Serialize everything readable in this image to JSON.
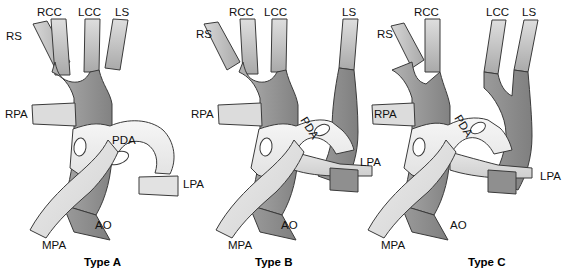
{
  "figure": {
    "panel_count": 3,
    "colors": {
      "aorta_dark": "#8a8a8a",
      "aorta_mid": "#9e9e9e",
      "branch_light": "#c9c9c9",
      "pulmonary_light": "#e9e9e9",
      "pda_light": "#f3f3f3",
      "outline": "#3a3a3a",
      "background": "#ffffff",
      "text": "#111111"
    }
  },
  "panels": [
    {
      "id": "type-a",
      "caption": "Type A",
      "labels": {
        "rs": "RS",
        "rcc": "RCC",
        "lcc": "LCC",
        "ls": "LS",
        "rpa": "RPA",
        "pda": "PDA",
        "lpa": "LPA",
        "ao": "AO",
        "mpa": "MPA"
      }
    },
    {
      "id": "type-b",
      "caption": "Type B",
      "labels": {
        "rs": "RS",
        "rcc": "RCC",
        "lcc": "LCC",
        "ls": "LS",
        "rpa": "RPA",
        "pda": "PDA",
        "lpa": "LPA",
        "ao": "AO",
        "mpa": "MPA"
      }
    },
    {
      "id": "type-c",
      "caption": "Type C",
      "labels": {
        "rs": "RS",
        "rcc": "RCC",
        "lcc": "LCC",
        "ls": "LS",
        "rpa": "RPA",
        "pda": "PDA",
        "lpa": "LPA",
        "ao": "AO",
        "mpa": "MPA"
      }
    }
  ]
}
